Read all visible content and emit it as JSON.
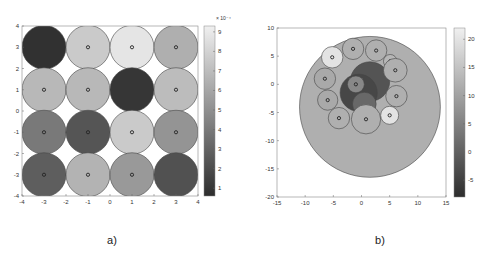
{
  "chart_data": [
    {
      "type": "scatter",
      "panel_label": "a)",
      "title": "",
      "xlabel": "",
      "ylabel": "",
      "xlim": [
        -4,
        4
      ],
      "ylim": [
        -4,
        4
      ],
      "xticks": [
        "-4",
        "-3",
        "-2",
        "-1",
        "0",
        "1",
        "2",
        "3",
        "4"
      ],
      "yticks": [
        "-4",
        "-3",
        "-2",
        "-1",
        "0",
        "1",
        "2",
        "3",
        "4"
      ],
      "colorbar": {
        "range": [
          0.6,
          9.3
        ],
        "ticks": [
          "1",
          "2",
          "3",
          "4",
          "5",
          "6",
          "7",
          "8",
          "9"
        ],
        "exponent_label": "× 10⁻⁴"
      },
      "grid": false,
      "circles": [
        {
          "x": -3,
          "y": 3,
          "r": 1,
          "value": 0.8,
          "marker": false
        },
        {
          "x": -1,
          "y": 3,
          "r": 1,
          "value": 7.6,
          "marker": true
        },
        {
          "x": 1,
          "y": 3,
          "r": 1,
          "value": 8.8,
          "marker": true
        },
        {
          "x": 3,
          "y": 3,
          "r": 1,
          "value": 6.4,
          "marker": true
        },
        {
          "x": -3,
          "y": 1,
          "r": 1,
          "value": 6.8,
          "marker": true
        },
        {
          "x": -1,
          "y": 1,
          "r": 1,
          "value": 6.8,
          "marker": true
        },
        {
          "x": 1,
          "y": 1,
          "r": 1,
          "value": 1.0,
          "marker": false
        },
        {
          "x": 3,
          "y": 1,
          "r": 1,
          "value": 7.0,
          "marker": true
        },
        {
          "x": -3,
          "y": -1,
          "r": 1,
          "value": 4.0,
          "marker": true
        },
        {
          "x": -1,
          "y": -1,
          "r": 1,
          "value": 2.4,
          "marker": true
        },
        {
          "x": 1,
          "y": -1,
          "r": 1,
          "value": 7.6,
          "marker": true
        },
        {
          "x": 3,
          "y": -1,
          "r": 1,
          "value": 5.2,
          "marker": true
        },
        {
          "x": -3,
          "y": -3,
          "r": 1,
          "value": 2.8,
          "marker": true
        },
        {
          "x": -1,
          "y": -3,
          "r": 1,
          "value": 6.6,
          "marker": true
        },
        {
          "x": 1,
          "y": -3,
          "r": 1,
          "value": 5.4,
          "marker": true
        },
        {
          "x": 3,
          "y": -3,
          "r": 1,
          "value": 2.2,
          "marker": false
        }
      ]
    },
    {
      "type": "scatter",
      "panel_label": "b)",
      "title": "",
      "xlabel": "",
      "ylabel": "",
      "xlim": [
        -15,
        15
      ],
      "ylim": [
        -20,
        10
      ],
      "xticks": [
        "-15",
        "-10",
        "-5",
        "0",
        "5",
        "10",
        "15"
      ],
      "yticks": [
        "-20",
        "-15",
        "-10",
        "-5",
        "0",
        "5",
        "10"
      ],
      "colorbar": {
        "range": [
          -8,
          22
        ],
        "ticks": [
          "-5",
          "0",
          "5",
          "10",
          "15",
          "20"
        ]
      },
      "grid": false,
      "circles": [
        {
          "x": 1.5,
          "y": -4,
          "r": 12.5,
          "value": 12,
          "marker": false
        },
        {
          "x": 1.5,
          "y": 0.5,
          "r": 3.5,
          "value": -2,
          "marker": false
        },
        {
          "x": -0.5,
          "y": -1.5,
          "r": 3.3,
          "value": -4,
          "marker": false
        },
        {
          "x": 0.5,
          "y": -3.5,
          "r": 2.1,
          "value": 1,
          "marker": false
        },
        {
          "x": -1,
          "y": 0,
          "r": 1.5,
          "value": 6,
          "marker": true
        },
        {
          "x": -5.2,
          "y": 4.8,
          "r": 1.9,
          "value": 20,
          "marker": true
        },
        {
          "x": -1.5,
          "y": 6.3,
          "r": 1.9,
          "value": 12,
          "marker": true
        },
        {
          "x": 2.6,
          "y": 6,
          "r": 1.9,
          "value": 12,
          "marker": true
        },
        {
          "x": 5.1,
          "y": 4.1,
          "r": 1.2,
          "value": 13,
          "marker": true
        },
        {
          "x": 6,
          "y": 2.5,
          "r": 2.1,
          "value": 12,
          "marker": true
        },
        {
          "x": -6.5,
          "y": 1,
          "r": 1.9,
          "value": 11,
          "marker": true
        },
        {
          "x": 6.2,
          "y": -2.1,
          "r": 1.9,
          "value": 12,
          "marker": true
        },
        {
          "x": -6,
          "y": -2.8,
          "r": 1.8,
          "value": 11,
          "marker": true
        },
        {
          "x": -4,
          "y": -6,
          "r": 1.9,
          "value": 12,
          "marker": true
        },
        {
          "x": 0.8,
          "y": -6.2,
          "r": 2.6,
          "value": 12,
          "marker": true
        },
        {
          "x": 5,
          "y": -5.5,
          "r": 1.6,
          "value": 20,
          "marker": true
        }
      ]
    }
  ]
}
